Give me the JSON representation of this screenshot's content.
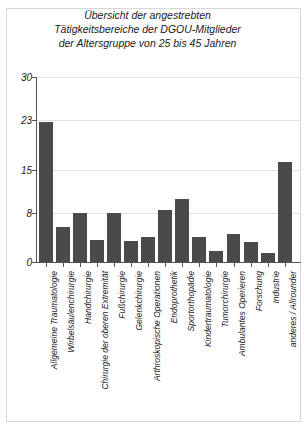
{
  "chart_data": {
    "type": "bar",
    "title": "Übersicht der angestrebten\nTätigkeitsbereiche der DGOU-Mitglieder\nder Altersgruppe von 25 bis 45 Jahren",
    "xlabel": "",
    "ylabel": "",
    "ylim": [
      0,
      30
    ],
    "yticks": [
      0,
      8,
      15,
      23,
      30
    ],
    "grid": true,
    "legend": false,
    "bar_color": "#4a4a4a",
    "categories": [
      "Allgemeine Traumatologie",
      "Wirbelsäulenchirurgie",
      "Handchirurgie",
      "Chirurgie der oberen Extremität",
      "Fußchirurgie",
      "Gelenkchirurgie",
      "Arthroskopische Operationen",
      "Endoprothetik",
      "Sportorthopädie",
      "Kindertraumatologie",
      "Tumorchirurgie",
      "Ambulantes Operieren",
      "Forschung",
      "Industrie",
      "anderes / Allrounder"
    ],
    "values": [
      22.7,
      5.7,
      8.0,
      3.5,
      8.0,
      3.4,
      4.0,
      8.5,
      10.2,
      4.0,
      1.8,
      4.5,
      3.3,
      1.5,
      16.2
    ]
  }
}
